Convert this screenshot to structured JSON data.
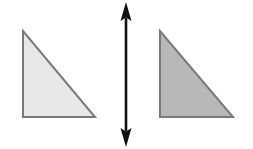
{
  "canvas": {
    "width": 253,
    "height": 149,
    "background_color": "#ffffff"
  },
  "figure": {
    "shapes": [
      {
        "name": "left-triangle",
        "type": "right-triangle",
        "label": "Left triangle",
        "fill_color": "#e8e8e8",
        "stroke_color": "#7a7a7a",
        "stroke_width": 2,
        "right_angle_corner": "bottom-left",
        "points": "23,31 23,117 95,117",
        "vertices": [
          {
            "x": 23,
            "y": 31
          },
          {
            "x": 23,
            "y": 117
          },
          {
            "x": 95,
            "y": 117
          }
        ],
        "width": 72,
        "height": 86
      },
      {
        "name": "right-triangle",
        "type": "right-triangle",
        "label": "Right triangle",
        "fill_color": "#b8b8b8",
        "stroke_color": "#7a7a7a",
        "stroke_width": 2,
        "right_angle_corner": "bottom-left",
        "points": "160,31 160,117 233,117",
        "vertices": [
          {
            "x": 160,
            "y": 31
          },
          {
            "x": 160,
            "y": 117
          },
          {
            "x": 233,
            "y": 117
          }
        ],
        "width": 73,
        "height": 86
      }
    ],
    "arrow": {
      "name": "vertical-double-arrow",
      "label": "Vertical double-headed arrow",
      "color": "#111111",
      "orientation": "vertical",
      "double_headed": true,
      "center_x": 126,
      "top_y": 2,
      "bottom_y": 147,
      "shaft_width": 2.6,
      "head_width": 11,
      "head_length": 18,
      "shaft_points": "124.7,18 127.3,18 127.3,131 124.7,131",
      "head_top_points": "126,2 131.5,21 126,17.5 120.5,21",
      "head_bottom_points": "126,147 120.5,128 126,131.5 131.5,128"
    }
  }
}
